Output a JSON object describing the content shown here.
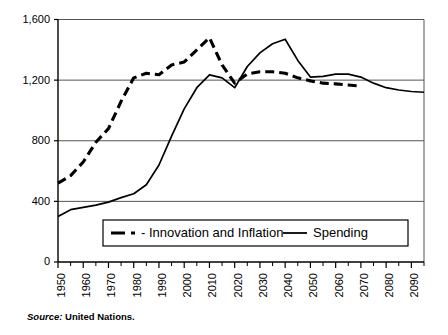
{
  "figure": {
    "source_prefix": "Source:",
    "source_text": "United Nations."
  },
  "chart_data": {
    "type": "line",
    "title": "",
    "xlabel": "",
    "ylabel": "",
    "xlim": [
      1950,
      2095
    ],
    "ylim": [
      0,
      1600
    ],
    "grid": true,
    "gridlines_y": [
      0,
      400,
      800,
      1200,
      1600
    ],
    "legend_position": "inside-bottom-center",
    "yticks": [
      0,
      400,
      800,
      1200,
      1600
    ],
    "ytick_labels": [
      "0",
      "400",
      "800",
      "1,200",
      "1,600"
    ],
    "xticks": [
      1950,
      1960,
      1970,
      1980,
      1990,
      2000,
      2010,
      2020,
      2030,
      2040,
      2050,
      2060,
      2070,
      2080,
      2090
    ],
    "xtick_labels": [
      "1950",
      "1960",
      "1970",
      "1980",
      "1990",
      "2000",
      "2010",
      "2020",
      "2030",
      "2040",
      "2050",
      "2060",
      "2070",
      "2080",
      "2090"
    ],
    "xminor_ticks": [
      1955,
      1965,
      1975,
      1985,
      1995,
      2005,
      2015,
      2025,
      2035,
      2045,
      2055,
      2065,
      2075,
      2085,
      2095
    ],
    "series": [
      {
        "name": "- Innovation and Inflation",
        "style": "dashed",
        "color": "#000000",
        "x": [
          1950,
          1955,
          1960,
          1965,
          1970,
          1975,
          1980,
          1985,
          1990,
          1995,
          2000,
          2005,
          2010,
          2015,
          2020,
          2025,
          2030,
          2035,
          2040,
          2045,
          2050,
          2055,
          2060,
          2065,
          2070
        ],
        "values": [
          520,
          570,
          660,
          790,
          880,
          1060,
          1215,
          1245,
          1235,
          1300,
          1320,
          1400,
          1480,
          1300,
          1180,
          1240,
          1255,
          1255,
          1245,
          1215,
          1195,
          1180,
          1175,
          1168,
          1160
        ]
      },
      {
        "name": "Spending",
        "style": "solid",
        "color": "#000000",
        "x": [
          1950,
          1955,
          1960,
          1965,
          1970,
          1975,
          1980,
          1985,
          1990,
          1995,
          2000,
          2005,
          2010,
          2015,
          2020,
          2025,
          2030,
          2035,
          2040,
          2045,
          2050,
          2055,
          2060,
          2065,
          2070,
          2075,
          2080,
          2085,
          2090,
          2095
        ],
        "values": [
          300,
          345,
          360,
          375,
          395,
          425,
          450,
          510,
          640,
          830,
          1010,
          1150,
          1235,
          1215,
          1150,
          1290,
          1380,
          1440,
          1470,
          1330,
          1220,
          1225,
          1240,
          1240,
          1220,
          1180,
          1150,
          1135,
          1125,
          1120
        ]
      }
    ],
    "legend": [
      {
        "label": "- Innovation and Inflation",
        "style": "dashed"
      },
      {
        "label": "Spending",
        "style": "solid"
      }
    ]
  }
}
